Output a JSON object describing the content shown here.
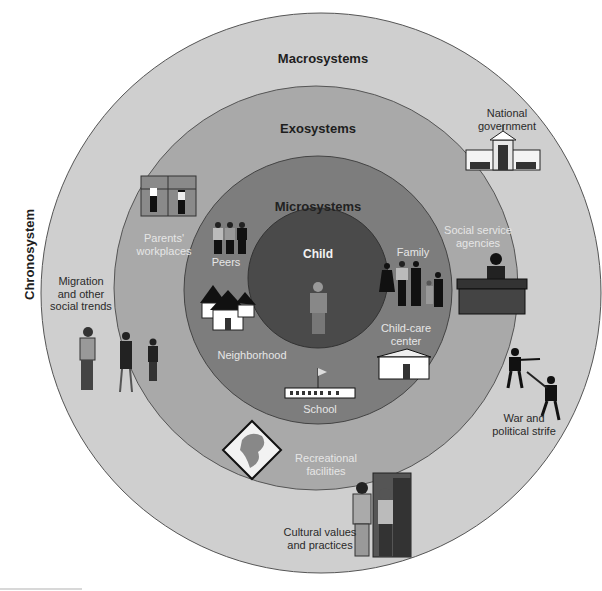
{
  "diagram": {
    "type": "nested-circles",
    "colors": {
      "background": "#ffffff",
      "macrosystem": "#cfcfcf",
      "exosystem": "#a8a8a8",
      "microsystem": "#7e7e7e",
      "child": "#4c4c4c",
      "outline": "#555555"
    },
    "side_label": "Chronosystem",
    "rings": {
      "macro": {
        "title": "Macrosystems",
        "items": [
          {
            "label_line1": "National",
            "label_line2": "government",
            "icon": "capitol-building-icon"
          },
          {
            "label_line1": "Migration",
            "label_line2": "and other",
            "label_line3": "social trends",
            "icon": "walking-people-icon"
          },
          {
            "label_line1": "War and",
            "label_line2": "political strife",
            "icon": "soldiers-icon"
          },
          {
            "label_line1": "Cultural values",
            "label_line2": "and practices",
            "icon": "couple-at-door-icon"
          }
        ]
      },
      "exo": {
        "title": "Exosystems",
        "items": [
          {
            "label_line1": "Parents'",
            "label_line2": "workplaces",
            "icon": "workplace-shelves-icon"
          },
          {
            "label_line1": "Social service",
            "label_line2": "agencies",
            "icon": "desk-clerk-icon"
          },
          {
            "label_line1": "Recreational",
            "label_line2": "facilities",
            "icon": "park-sign-icon"
          }
        ]
      },
      "micro": {
        "title": "Microsystems",
        "items": [
          {
            "label": "Peers",
            "icon": "peer-group-icon"
          },
          {
            "label": "Family",
            "icon": "family-icon"
          },
          {
            "label": "Neighborhood",
            "icon": "houses-icon"
          },
          {
            "label_line1": "Child-care",
            "label_line2": "center",
            "icon": "childcare-building-icon"
          },
          {
            "label": "School",
            "icon": "school-building-icon"
          }
        ]
      },
      "center": {
        "title": "Child",
        "icon": "child-figure-icon"
      }
    }
  }
}
